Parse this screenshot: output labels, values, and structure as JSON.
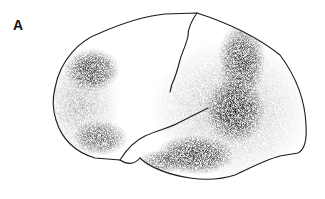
{
  "figure": {
    "panel_label": "A",
    "colors": {
      "background": "#ffffff",
      "outline": "#1a1a1a",
      "stipple": "#111111"
    },
    "shaded_regions": [
      {
        "name": "frontal-upper",
        "cx": 92,
        "cy": 70,
        "rx": 26,
        "ry": 20,
        "opacity": 0.75
      },
      {
        "name": "frontal-lower",
        "cx": 97,
        "cy": 135,
        "rx": 26,
        "ry": 16,
        "opacity": 0.6
      },
      {
        "name": "parietal-temporal-band-upper",
        "cx": 240,
        "cy": 65,
        "rx": 25,
        "ry": 35,
        "opacity": 0.75
      },
      {
        "name": "parietal-temporal-band-mid",
        "cx": 232,
        "cy": 120,
        "rx": 30,
        "ry": 30,
        "opacity": 0.8
      },
      {
        "name": "temporal-lower",
        "cx": 185,
        "cy": 160,
        "rx": 35,
        "ry": 16,
        "opacity": 0.75
      }
    ]
  }
}
